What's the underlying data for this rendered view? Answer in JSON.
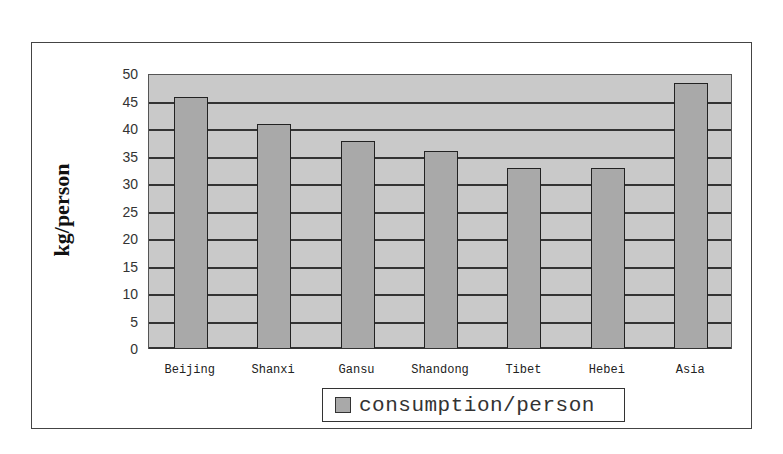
{
  "chart_data": {
    "type": "bar",
    "title": "",
    "xlabel": "",
    "ylabel": "kg/person",
    "ylim": [
      0,
      50
    ],
    "yticks": [
      0,
      5,
      10,
      15,
      20,
      25,
      30,
      35,
      40,
      45,
      50
    ],
    "grid": true,
    "legend_position": "bottom",
    "categories": [
      "Beijing",
      "Shanxi",
      "Gansu",
      "Shandong",
      "Tibet",
      "Hebei",
      "Asia"
    ],
    "series": [
      {
        "name": "consumption/person",
        "values": [
          45.6,
          40.7,
          37.6,
          35.8,
          32.7,
          32.7,
          48.2
        ],
        "color": "#a9a9a9"
      }
    ]
  },
  "colors": {
    "plot_bg": "#c9c9c9",
    "bar": "#a9a9a9",
    "grid": "#333333"
  }
}
